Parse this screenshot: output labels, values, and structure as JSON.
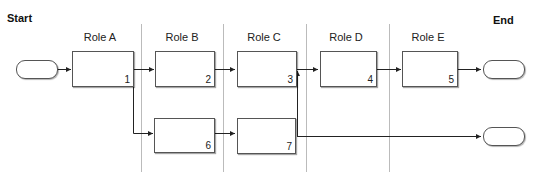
{
  "start_label": "Start",
  "end_label": "End",
  "lanes": [
    {
      "label": "Role A"
    },
    {
      "label": "Role B"
    },
    {
      "label": "Role C"
    },
    {
      "label": "Role D"
    },
    {
      "label": "Role E"
    }
  ],
  "nodes": [
    {
      "id": "1",
      "lane": "Role A",
      "label": "1"
    },
    {
      "id": "2",
      "lane": "Role B",
      "label": "2"
    },
    {
      "id": "3",
      "lane": "Role C",
      "label": "3"
    },
    {
      "id": "4",
      "lane": "Role D",
      "label": "4"
    },
    {
      "id": "5",
      "lane": "Role E",
      "label": "5"
    },
    {
      "id": "6",
      "lane": "Role B",
      "label": "6"
    },
    {
      "id": "7",
      "lane": "Role C",
      "label": "7"
    }
  ],
  "edges": [
    {
      "from": "start",
      "to": "1"
    },
    {
      "from": "1",
      "to": "2"
    },
    {
      "from": "1",
      "to": "6"
    },
    {
      "from": "2",
      "to": "3"
    },
    {
      "from": "6",
      "to": "7"
    },
    {
      "from": "7",
      "to": "3"
    },
    {
      "from": "3",
      "to": "4"
    },
    {
      "from": "4",
      "to": "5"
    },
    {
      "from": "5",
      "to": "end-top"
    },
    {
      "from": "7",
      "to": "end-bottom"
    }
  ],
  "colors": {
    "line": "#222222",
    "separator": "#bbbbbb",
    "box_border": "#555555"
  }
}
